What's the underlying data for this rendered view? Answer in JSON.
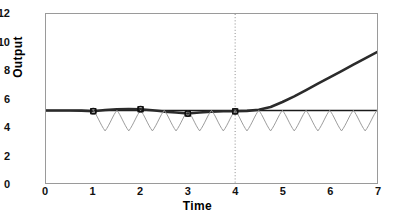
{
  "chart_data": {
    "type": "line",
    "title": "",
    "xlabel": "Time",
    "ylabel": "Output",
    "xlim": [
      0,
      7
    ],
    "ylim": [
      0,
      12
    ],
    "xticks": [
      0,
      1,
      2,
      3,
      4,
      5,
      6,
      7
    ],
    "yticks": [
      0,
      2,
      4,
      6,
      8,
      10,
      12
    ],
    "xtick_labels": [
      "0",
      "1",
      "2",
      "3",
      "4",
      "5",
      "6",
      "7"
    ],
    "ytick_labels": [
      "0",
      "2",
      "4",
      "6",
      "8",
      "10",
      "12"
    ],
    "grid": false,
    "legend": null,
    "series": [
      {
        "name": "setpoint-reference",
        "style": "solid-thin",
        "color": "#1a1a1a",
        "width": 1.6,
        "description": "Flat horizontal reference level across full time range",
        "x": [
          0,
          1,
          2,
          3,
          4,
          5,
          6,
          7
        ],
        "values": [
          5.15,
          5.15,
          5.15,
          5.15,
          5.15,
          5.15,
          5.15,
          5.15
        ]
      },
      {
        "name": "response-output",
        "style": "solid-thick",
        "color": "#2b2b2b",
        "width": 2.6,
        "description": "Output holds near setpoint then rises exponentially after t=4.5",
        "x": [
          0,
          0.25,
          0.5,
          0.75,
          1,
          1.25,
          1.5,
          1.75,
          2,
          2.25,
          2.5,
          2.75,
          3,
          3.25,
          3.5,
          3.75,
          4,
          4.25,
          4.5,
          4.75,
          5,
          5.25,
          5.5,
          5.75,
          6,
          6.25,
          6.5,
          6.75,
          7
        ],
        "values": [
          5.15,
          5.15,
          5.15,
          5.14,
          5.1,
          5.18,
          5.24,
          5.26,
          5.24,
          5.16,
          5.07,
          5.0,
          4.93,
          5.0,
          5.07,
          5.1,
          5.09,
          5.12,
          5.2,
          5.4,
          5.75,
          6.15,
          6.6,
          7.05,
          7.5,
          7.95,
          8.4,
          8.85,
          9.3
        ]
      },
      {
        "name": "oscillating-signal",
        "style": "solid-thin-gray",
        "color": "#9b9b9b",
        "width": 1.0,
        "description": "Saw/V-shaped oscillation, period 0.5, peaks clipped at 5.15, troughs at 3.7, begins at t=1",
        "period": 0.5,
        "peak": 5.15,
        "trough": 3.7,
        "start_x": 1.0,
        "end_x": 7.0
      }
    ],
    "markers": {
      "name": "sample-points",
      "shape": "square-circle-overlay",
      "color": "#111111",
      "size": 5,
      "x": [
        1,
        2,
        3,
        4
      ],
      "values": [
        5.1,
        5.24,
        4.93,
        5.09
      ]
    },
    "annotations": [
      {
        "name": "vertical-divider",
        "type": "vline",
        "x": 4,
        "style": "dotted",
        "color": "#8a8a8a"
      }
    ]
  }
}
